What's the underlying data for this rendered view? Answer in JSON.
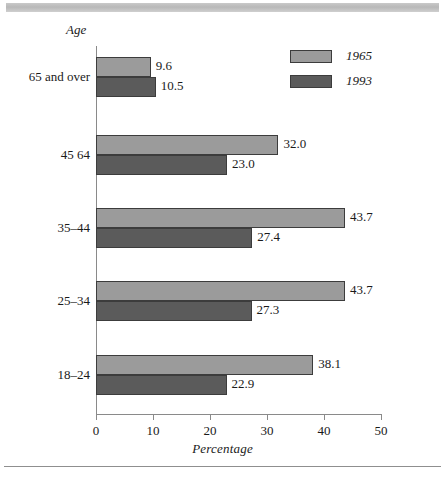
{
  "page": {
    "top_rule": "",
    "bottom_rule": ""
  },
  "chart_data": {
    "type": "bar",
    "orientation": "horizontal",
    "title": "",
    "xlabel": "Percentage",
    "ylabel": "Age",
    "xlim": [
      0,
      50
    ],
    "xticks": [
      "0",
      "10",
      "20",
      "30",
      "40",
      "50"
    ],
    "grid": false,
    "legend_position": "top-right",
    "categories": [
      "65 and over",
      "45  64",
      "35–44",
      "25–34",
      "18–24"
    ],
    "series": [
      {
        "name": "1965",
        "color": "#9b9b9b",
        "values": [
          9.6,
          32.0,
          43.7,
          43.7,
          38.1
        ],
        "labels": [
          "9.6",
          "32.0",
          "43.7",
          "43.7",
          "38.1"
        ]
      },
      {
        "name": "1993",
        "color": "#5b5b5b",
        "values": [
          10.5,
          23.0,
          27.4,
          27.3,
          22.9
        ],
        "labels": [
          "10.5",
          "23.0",
          "27.4",
          "27.3",
          "22.9"
        ]
      }
    ]
  },
  "legend": {
    "items": [
      {
        "label": "1965",
        "color": "#9b9b9b"
      },
      {
        "label": "1993",
        "color": "#5b5b5b"
      }
    ]
  },
  "axis": {
    "x_title": "Percentage",
    "y_title": "Age",
    "ticks": [
      {
        "value": "0"
      },
      {
        "value": "10"
      },
      {
        "value": "20"
      },
      {
        "value": "30"
      },
      {
        "value": "40"
      },
      {
        "value": "50"
      }
    ]
  }
}
